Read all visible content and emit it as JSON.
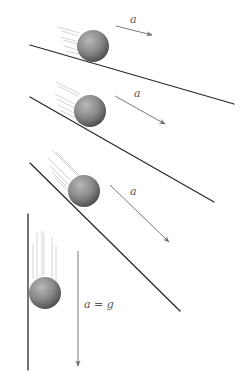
{
  "diagram": {
    "title": "",
    "colors": {
      "surface": "#2a2a2a",
      "arrow": "#6a6a6a",
      "motion_lines": "#c8c8c8",
      "ball_light": "#b8b8b8",
      "ball_mid": "#8a8a8a",
      "ball_dark": "#4e4e4e",
      "label": "#555555"
    },
    "panels": [
      {
        "id": "shallow-incline",
        "surface": {
          "x1": 30,
          "y1": 45,
          "x2": 234,
          "y2": 104
        },
        "ball": {
          "cx": 93,
          "cy": 46,
          "r": 16
        },
        "motion_lines": [
          {
            "x1": 58,
            "y1": 27,
            "x2": 80,
            "y2": 33
          },
          {
            "x1": 62,
            "y1": 31,
            "x2": 78,
            "y2": 36
          },
          {
            "x1": 60,
            "y1": 37,
            "x2": 76,
            "y2": 41
          },
          {
            "x1": 63,
            "y1": 40,
            "x2": 77,
            "y2": 44
          },
          {
            "x1": 64,
            "y1": 46,
            "x2": 78,
            "y2": 50
          },
          {
            "x1": 66,
            "y1": 51,
            "x2": 79,
            "y2": 54
          }
        ],
        "arrow": {
          "x1": 116,
          "y1": 26,
          "x2": 152,
          "y2": 35
        },
        "label": {
          "text": "a",
          "x": 130,
          "y": 23
        }
      },
      {
        "id": "medium-incline",
        "surface": {
          "x1": 30,
          "y1": 97,
          "x2": 214,
          "y2": 202
        },
        "ball": {
          "cx": 90,
          "cy": 111,
          "r": 16
        },
        "motion_lines": [
          {
            "x1": 56,
            "y1": 82,
            "x2": 80,
            "y2": 94
          },
          {
            "x1": 58,
            "y1": 86,
            "x2": 78,
            "y2": 96
          },
          {
            "x1": 55,
            "y1": 94,
            "x2": 75,
            "y2": 104
          },
          {
            "x1": 57,
            "y1": 99,
            "x2": 74,
            "y2": 108
          },
          {
            "x1": 58,
            "y1": 105,
            "x2": 74,
            "y2": 113
          },
          {
            "x1": 60,
            "y1": 110,
            "x2": 75,
            "y2": 118
          }
        ],
        "arrow": {
          "x1": 115,
          "y1": 96,
          "x2": 165,
          "y2": 124
        },
        "label": {
          "text": "a",
          "x": 134,
          "y": 97
        }
      },
      {
        "id": "steep-incline",
        "surface": {
          "x1": 30,
          "y1": 163,
          "x2": 180,
          "y2": 311
        },
        "ball": {
          "cx": 84,
          "cy": 191,
          "r": 16
        },
        "motion_lines": [
          {
            "x1": 52,
            "y1": 150,
            "x2": 78,
            "y2": 176
          },
          {
            "x1": 56,
            "y1": 152,
            "x2": 80,
            "y2": 176
          },
          {
            "x1": 48,
            "y1": 158,
            "x2": 70,
            "y2": 180
          },
          {
            "x1": 50,
            "y1": 166,
            "x2": 70,
            "y2": 186
          },
          {
            "x1": 52,
            "y1": 172,
            "x2": 68,
            "y2": 188
          },
          {
            "x1": 55,
            "y1": 178,
            "x2": 68,
            "y2": 191
          }
        ],
        "arrow": {
          "x1": 110,
          "y1": 185,
          "x2": 169,
          "y2": 242
        },
        "label": {
          "text": "a",
          "x": 130,
          "y": 195
        }
      },
      {
        "id": "vertical-drop",
        "surface": {
          "x1": 28,
          "y1": 214,
          "x2": 28,
          "y2": 370
        },
        "ball": {
          "cx": 45,
          "cy": 293,
          "r": 16
        },
        "motion_lines": [
          {
            "x1": 33,
            "y1": 244,
            "x2": 33,
            "y2": 279
          },
          {
            "x1": 37,
            "y1": 233,
            "x2": 37,
            "y2": 278
          },
          {
            "x1": 42,
            "y1": 231,
            "x2": 42,
            "y2": 276
          },
          {
            "x1": 44,
            "y1": 233,
            "x2": 44,
            "y2": 276
          },
          {
            "x1": 52,
            "y1": 237,
            "x2": 52,
            "y2": 279
          },
          {
            "x1": 56,
            "y1": 246,
            "x2": 56,
            "y2": 282
          }
        ],
        "arrow": {
          "x1": 78,
          "y1": 251,
          "x2": 78,
          "y2": 366
        },
        "label": {
          "text": "a = g",
          "x": 84,
          "y": 308
        }
      }
    ]
  }
}
